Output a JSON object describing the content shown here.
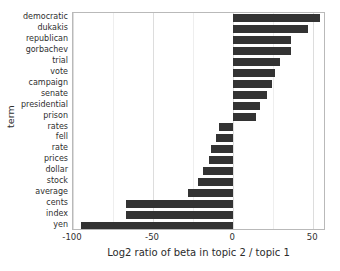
{
  "chart_data": {
    "type": "bar",
    "orientation": "horizontal",
    "title": "",
    "xlabel": "Log2 ratio of beta in topic 2 / topic 1",
    "ylabel": "term",
    "xlim": [
      -100,
      58
    ],
    "xticks": [
      -100,
      -50,
      0,
      50
    ],
    "xtick_labels": [
      "-100",
      "-50",
      "0",
      "50"
    ],
    "grid": true,
    "legend": "none",
    "bar_color": "#333333",
    "categories": [
      "democratic",
      "dukakis",
      "republican",
      "gorbachev",
      "trial",
      "vote",
      "campaign",
      "senate",
      "presidential",
      "prison",
      "rates",
      "fell",
      "rate",
      "prices",
      "dollar",
      "stock",
      "average",
      "cents",
      "index",
      "yen"
    ],
    "values": [
      54,
      47,
      36,
      36,
      29,
      26,
      24,
      21,
      17,
      14,
      -9,
      -11,
      -14,
      -15,
      -19,
      -22,
      -28,
      -67,
      -67,
      -95
    ]
  }
}
